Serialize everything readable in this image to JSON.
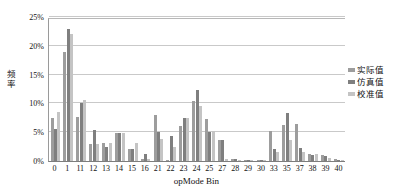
{
  "chart_data": {
    "type": "bar",
    "title": "",
    "xlabel": "opMode Bin",
    "ylabel": "频率",
    "ylim": [
      0,
      25
    ],
    "yticks": [
      "0%",
      "5%",
      "10%",
      "15%",
      "20%",
      "25%"
    ],
    "ytick_values": [
      0,
      5,
      10,
      15,
      20,
      25
    ],
    "grid": true,
    "legend_position": "right",
    "categories": [
      "0",
      "1",
      "11",
      "12",
      "13",
      "14",
      "15",
      "16",
      "21",
      "22",
      "23",
      "24",
      "25",
      "27",
      "28",
      "29",
      "30",
      "33",
      "35",
      "37",
      "38",
      "39",
      "40"
    ],
    "series": [
      {
        "name": "实际值",
        "color": "#9d9d9d",
        "values": [
          7.5,
          19.0,
          7.6,
          3.0,
          3.2,
          4.9,
          2.1,
          0.3,
          8.0,
          0.2,
          6.0,
          10.4,
          7.3,
          3.7,
          0.3,
          0.2,
          0.2,
          5.2,
          6.2,
          6.4,
          1.2,
          1.0,
          0.3
        ]
      },
      {
        "name": "仿真值",
        "color": "#7f7f7f",
        "values": [
          5.5,
          22.9,
          10.1,
          5.4,
          2.4,
          4.9,
          2.1,
          1.2,
          5.0,
          4.3,
          7.5,
          12.3,
          5.1,
          3.6,
          0.3,
          0.2,
          0.2,
          2.1,
          8.4,
          2.2,
          1.0,
          0.8,
          0.2
        ]
      },
      {
        "name": "校准值",
        "color": "#c4c4c4",
        "values": [
          8.5,
          22.1,
          10.6,
          3.0,
          3.2,
          4.9,
          3.2,
          0.3,
          3.8,
          2.5,
          7.5,
          9.6,
          5.2,
          0.4,
          0.2,
          0.2,
          0.2,
          1.6,
          3.6,
          1.6,
          1.3,
          0.5,
          0.2
        ]
      }
    ]
  },
  "axis": {
    "y_title_chars": [
      "频",
      "率"
    ]
  }
}
